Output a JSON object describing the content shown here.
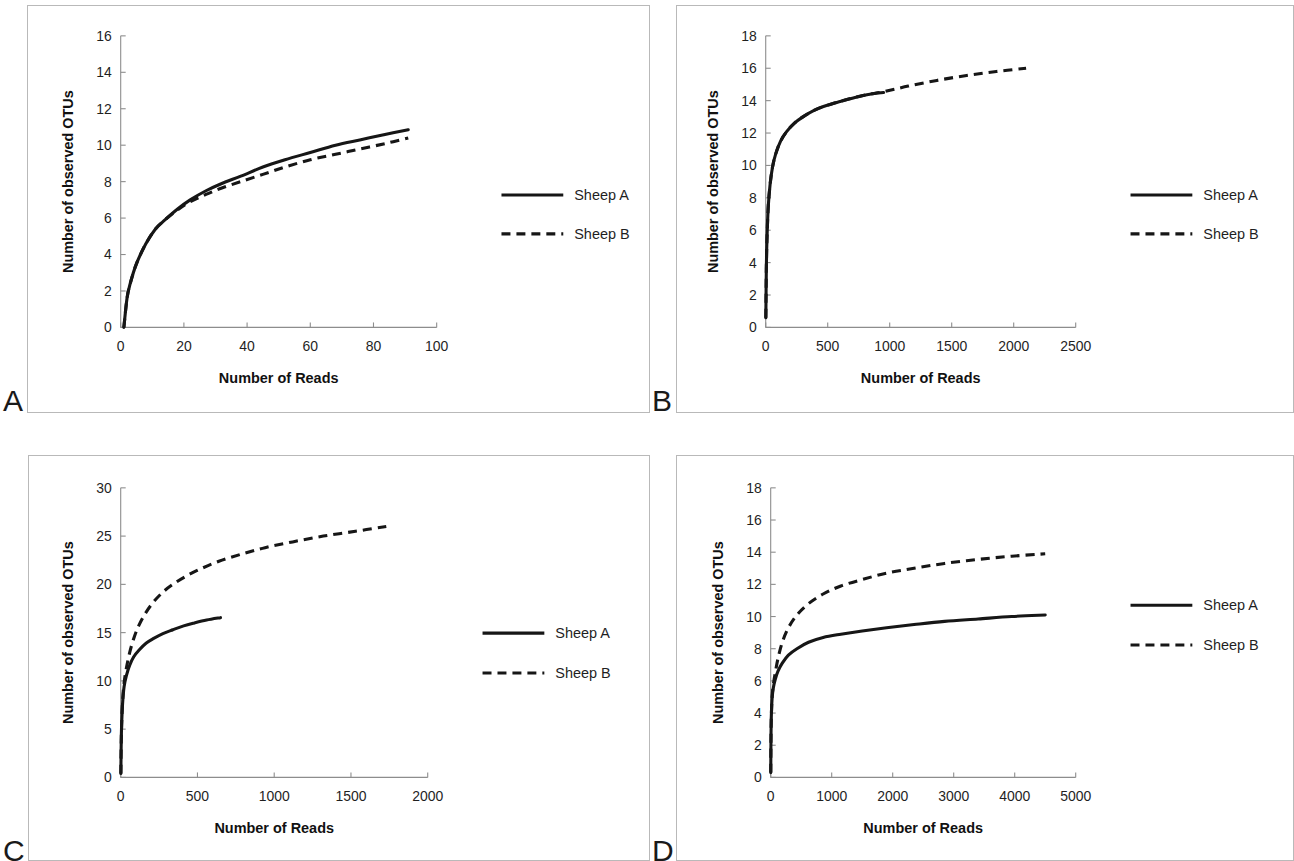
{
  "figure": {
    "panel_letters": [
      "A",
      "B",
      "C",
      "D"
    ],
    "legend_entries": [
      "Sheep A",
      "Sheep B"
    ],
    "axis_titles": {
      "x": "Number of Reads",
      "y": "Number of observed OTUs"
    }
  },
  "panels": [
    {
      "letter": "A",
      "xlabel": "Number of Reads",
      "ylabel": "Number of observed OTUs"
    },
    {
      "letter": "B",
      "xlabel": "Number of Reads",
      "ylabel": "Number of observed OTUs"
    },
    {
      "letter": "C",
      "xlabel": "Number of Reads",
      "ylabel": "Number of observed OTUs"
    },
    {
      "letter": "D",
      "xlabel": "Number of Reads",
      "ylabel": "Number of observed OTUs"
    }
  ],
  "chart_data": [
    {
      "panel": "A",
      "type": "line",
      "title": "",
      "xlabel": "Number of Reads",
      "ylabel": "Number of observed OTUs",
      "xlim": [
        0,
        100
      ],
      "ylim": [
        0,
        16
      ],
      "xticks": [
        0,
        20,
        40,
        60,
        80,
        100
      ],
      "yticks": [
        0,
        2,
        4,
        6,
        8,
        10,
        12,
        14,
        16
      ],
      "xtick_labels": [
        "0",
        "20",
        "40",
        "60",
        "80",
        "100"
      ],
      "ytick_labels": [
        "0",
        "2",
        "4",
        "6",
        "8",
        "10",
        "12",
        "14",
        "16"
      ],
      "grid": false,
      "legend_position": "right",
      "series": [
        {
          "name": "Sheep A",
          "style": "solid",
          "color": "#161616",
          "x": [
            1,
            2,
            3,
            5,
            8,
            11,
            14,
            18,
            22,
            27,
            32,
            38,
            45,
            52,
            60,
            68,
            76,
            84,
            91
          ],
          "y": [
            0.0,
            1.6,
            2.4,
            3.5,
            4.6,
            5.4,
            5.9,
            6.5,
            7.0,
            7.5,
            7.9,
            8.3,
            8.8,
            9.2,
            9.6,
            10.0,
            10.3,
            10.6,
            10.85
          ]
        },
        {
          "name": "Sheep B",
          "style": "dashed",
          "color": "#161616",
          "x": [
            1,
            2,
            3,
            5,
            8,
            11,
            14,
            18,
            22,
            27,
            32,
            38,
            45,
            52,
            60,
            68,
            76,
            84,
            91
          ],
          "y": [
            0.0,
            1.6,
            2.4,
            3.5,
            4.6,
            5.4,
            5.9,
            6.45,
            6.9,
            7.3,
            7.65,
            8.0,
            8.4,
            8.8,
            9.2,
            9.5,
            9.8,
            10.1,
            10.4
          ]
        }
      ]
    },
    {
      "panel": "B",
      "type": "line",
      "title": "",
      "xlabel": "Number of Reads",
      "ylabel": "Number of observed OTUs",
      "xlim": [
        0,
        2500
      ],
      "ylim": [
        0,
        18
      ],
      "xticks": [
        0,
        500,
        1000,
        1500,
        2000,
        2500
      ],
      "yticks": [
        0,
        2,
        4,
        6,
        8,
        10,
        12,
        14,
        16,
        18
      ],
      "xtick_labels": [
        "0",
        "500",
        "1000",
        "1500",
        "2000",
        "2500"
      ],
      "ytick_labels": [
        "0",
        "2",
        "4",
        "6",
        "8",
        "10",
        "12",
        "14",
        "16",
        "18"
      ],
      "grid": false,
      "legend_position": "right",
      "series": [
        {
          "name": "Sheep A",
          "style": "solid",
          "color": "#161616",
          "x": [
            1,
            5,
            10,
            20,
            35,
            55,
            80,
            120,
            170,
            230,
            300,
            390,
            490,
            600,
            720,
            840,
            950
          ],
          "y": [
            0.6,
            3.6,
            5.4,
            7.4,
            8.8,
            9.9,
            10.7,
            11.5,
            12.1,
            12.6,
            13.0,
            13.4,
            13.7,
            13.95,
            14.2,
            14.4,
            14.5
          ]
        },
        {
          "name": "Sheep B",
          "style": "dashed",
          "color": "#161616",
          "x": [
            1,
            5,
            10,
            20,
            35,
            55,
            80,
            120,
            170,
            230,
            300,
            390,
            490,
            600,
            720,
            840,
            950,
            1150,
            1380,
            1620,
            1860,
            2100
          ],
          "y": [
            0.6,
            3.6,
            5.4,
            7.4,
            8.8,
            9.9,
            10.7,
            11.5,
            12.1,
            12.6,
            13.0,
            13.4,
            13.7,
            13.95,
            14.2,
            14.4,
            14.55,
            14.9,
            15.25,
            15.55,
            15.8,
            16.0
          ]
        }
      ]
    },
    {
      "panel": "C",
      "type": "line",
      "title": "",
      "xlabel": "Number of Reads",
      "ylabel": "Number of observed OTUs",
      "xlim": [
        0,
        2000
      ],
      "ylim": [
        0,
        30
      ],
      "xticks": [
        0,
        500,
        1000,
        1500,
        2000
      ],
      "yticks": [
        0,
        5,
        10,
        15,
        20,
        25,
        30
      ],
      "xtick_labels": [
        "0",
        "500",
        "1000",
        "1500",
        "2000"
      ],
      "ytick_labels": [
        "0",
        "5",
        "10",
        "15",
        "20",
        "25",
        "30"
      ],
      "grid": false,
      "legend_position": "right",
      "series": [
        {
          "name": "Sheep A",
          "style": "solid",
          "color": "#161616",
          "x": [
            1,
            3,
            6,
            12,
            22,
            38,
            58,
            85,
            120,
            165,
            215,
            275,
            340,
            410,
            480,
            560,
            650
          ],
          "y": [
            0.4,
            3.2,
            5.4,
            7.6,
            9.4,
            10.6,
            11.6,
            12.5,
            13.2,
            13.9,
            14.4,
            14.9,
            15.3,
            15.7,
            16.0,
            16.3,
            16.55
          ]
        },
        {
          "name": "Sheep B",
          "style": "dashed",
          "color": "#161616",
          "x": [
            1,
            3,
            6,
            12,
            22,
            38,
            58,
            85,
            120,
            165,
            215,
            275,
            340,
            420,
            520,
            640,
            780,
            940,
            1120,
            1320,
            1530,
            1730
          ],
          "y": [
            0.4,
            3.2,
            5.4,
            7.8,
            9.8,
            11.4,
            12.9,
            14.4,
            15.8,
            17.1,
            18.2,
            19.2,
            20.0,
            20.8,
            21.6,
            22.4,
            23.1,
            23.8,
            24.4,
            25.0,
            25.5,
            26.0
          ]
        }
      ]
    },
    {
      "panel": "D",
      "type": "line",
      "title": "",
      "xlabel": "Number of Reads",
      "ylabel": "Number of observed OTUs",
      "xlim": [
        0,
        5000
      ],
      "ylim": [
        0,
        18
      ],
      "xticks": [
        0,
        1000,
        2000,
        3000,
        4000,
        5000
      ],
      "yticks": [
        0,
        2,
        4,
        6,
        8,
        10,
        12,
        14,
        16,
        18
      ],
      "xtick_labels": [
        "0",
        "1000",
        "2000",
        "3000",
        "4000",
        "5000"
      ],
      "ytick_labels": [
        "0",
        "2",
        "4",
        "6",
        "8",
        "10",
        "12",
        "14",
        "16",
        "18"
      ],
      "grid": false,
      "legend_position": "right",
      "series": [
        {
          "name": "Sheep A",
          "style": "solid",
          "color": "#161616",
          "x": [
            1,
            5,
            12,
            25,
            45,
            75,
            120,
            190,
            290,
            430,
            620,
            860,
            1150,
            1500,
            1900,
            2350,
            2850,
            3400,
            3950,
            4500
          ],
          "y": [
            0.3,
            2.6,
            4.0,
            5.0,
            5.6,
            6.1,
            6.6,
            7.1,
            7.6,
            8.0,
            8.4,
            8.7,
            8.9,
            9.1,
            9.3,
            9.5,
            9.7,
            9.85,
            10.0,
            10.1
          ]
        },
        {
          "name": "Sheep B",
          "style": "dashed",
          "color": "#161616",
          "x": [
            1,
            5,
            12,
            25,
            45,
            75,
            120,
            190,
            290,
            430,
            620,
            860,
            1150,
            1500,
            1900,
            2350,
            2850,
            3400,
            3950,
            4500
          ],
          "y": [
            0.3,
            2.6,
            4.0,
            5.1,
            5.8,
            6.5,
            7.4,
            8.4,
            9.3,
            10.1,
            10.8,
            11.4,
            11.9,
            12.3,
            12.7,
            13.0,
            13.3,
            13.55,
            13.75,
            13.9
          ]
        }
      ]
    }
  ]
}
